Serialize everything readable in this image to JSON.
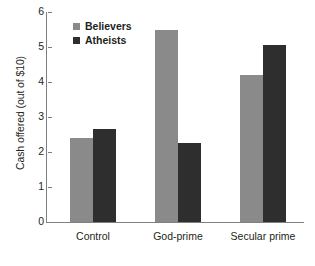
{
  "chart_data": {
    "type": "bar",
    "title": "",
    "xlabel": "",
    "ylabel": "Cash offered (out of $10)",
    "categories": [
      "Control",
      "God-prime",
      "Secular prime"
    ],
    "series": [
      {
        "name": "Believers",
        "color": "#8a8a8a",
        "values": [
          2.4,
          5.5,
          4.2
        ]
      },
      {
        "name": "Atheists",
        "color": "#2e2e2e",
        "values": [
          2.65,
          2.25,
          5.05
        ]
      }
    ],
    "ylim": [
      0,
      6
    ],
    "ytick_labels": [
      "0",
      "1",
      "2",
      "3",
      "4",
      "5",
      "6"
    ],
    "ytick_values": [
      0,
      1,
      2,
      3,
      4,
      5,
      6
    ],
    "grid": false,
    "legend_position": "top-left"
  }
}
